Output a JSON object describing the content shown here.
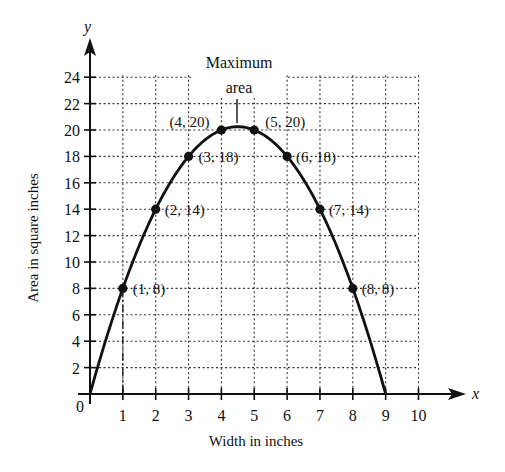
{
  "chart_data": {
    "type": "line",
    "title": "",
    "function": "A = 9x - x^2",
    "xlabel": "Width in inches",
    "ylabel": "Area in square inches",
    "x_axis_variable": "x",
    "y_axis_variable": "y",
    "xlim": [
      0,
      10
    ],
    "ylim": [
      0,
      24
    ],
    "x_ticks": [
      "1",
      "2",
      "3",
      "4",
      "5",
      "6",
      "7",
      "8",
      "9",
      "10"
    ],
    "y_ticks": [
      "2",
      "4",
      "6",
      "8",
      "10",
      "12",
      "14",
      "16",
      "18",
      "20",
      "22",
      "24"
    ],
    "origin_label": "0",
    "grid": true,
    "grid_style": "dotted",
    "legend": null,
    "curve": {
      "x": [
        0,
        0.5,
        1,
        1.5,
        2,
        2.5,
        3,
        3.5,
        4,
        4.5,
        5,
        5.5,
        6,
        6.5,
        7,
        7.5,
        8,
        8.5,
        9
      ],
      "y": [
        0,
        4.25,
        8,
        11.25,
        14,
        16.25,
        18,
        19.25,
        20,
        20.25,
        20,
        19.25,
        18,
        16.25,
        14,
        11.25,
        8,
        4.25,
        0
      ]
    },
    "points": [
      {
        "x": 1,
        "y": 8,
        "label": "(1, 8)"
      },
      {
        "x": 2,
        "y": 14,
        "label": "(2, 14)"
      },
      {
        "x": 3,
        "y": 18,
        "label": "(3, 18)"
      },
      {
        "x": 4,
        "y": 20,
        "label": "(4, 20)"
      },
      {
        "x": 5,
        "y": 20,
        "label": "(5, 20)"
      },
      {
        "x": 6,
        "y": 18,
        "label": "(6, 18)"
      },
      {
        "x": 7,
        "y": 14,
        "label": "(7, 14)"
      },
      {
        "x": 8,
        "y": 8,
        "label": "(8, 8)"
      }
    ],
    "annotations": [
      {
        "text_line1": "Maximum",
        "text_line2": "area",
        "x": 4.5,
        "y": 20.25
      }
    ]
  }
}
